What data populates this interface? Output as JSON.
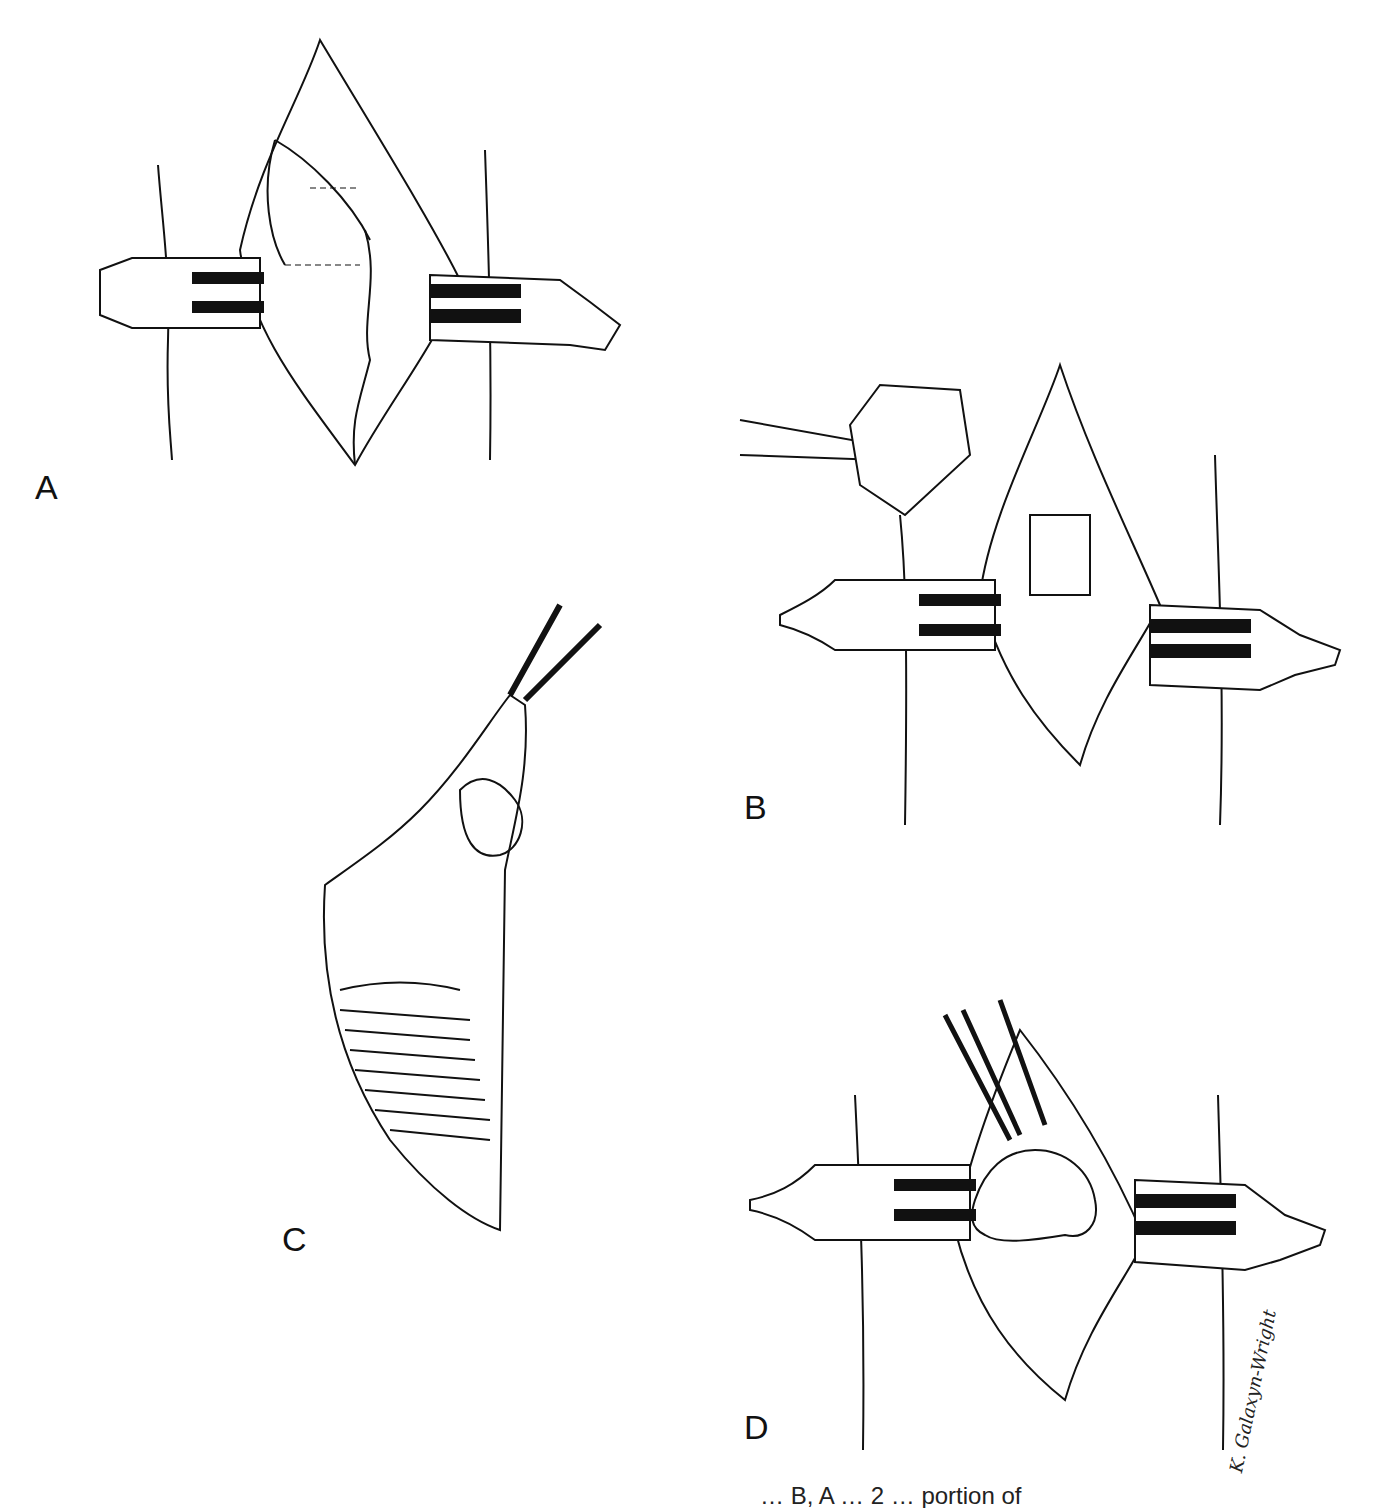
{
  "figure": {
    "panels": [
      {
        "id": "A",
        "label": "A",
        "description": "Open incision with two retractors holding wound edges; dashed cut lines marked on exposed fascia"
      },
      {
        "id": "B",
        "label": "B",
        "description": "Retracted incision with a block of tissue held by forceps at upper left; rectangular section being excised"
      },
      {
        "id": "C",
        "label": "C",
        "description": "Triangular flap of tissue lifted by forceps, exposing striated muscle beneath"
      },
      {
        "id": "D",
        "label": "D",
        "description": "Retracted incision with lobulated tissue mass grasped by forceps"
      }
    ],
    "signature": "K. Galaxyn-Wright",
    "caption_fragment": "… B, A … 2 … portion of"
  },
  "colors": {
    "ink": "#111111",
    "paper": "#ffffff"
  }
}
